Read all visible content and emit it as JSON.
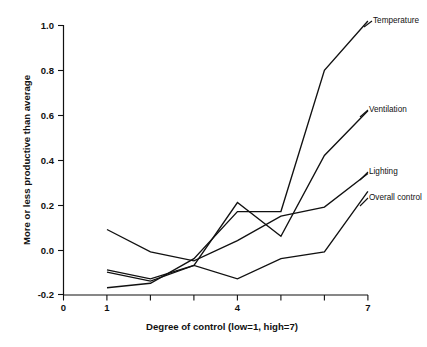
{
  "chart_data": {
    "type": "line",
    "title": "",
    "xlabel": "Degree of control (low=1, high=7)",
    "ylabel": "More or less productive than average",
    "xlim": [
      0,
      7
    ],
    "ylim": [
      -0.2,
      1.0
    ],
    "grid": false,
    "legend_position": "right-inline-labels",
    "x": [
      1,
      2,
      3,
      4,
      5,
      6,
      7
    ],
    "x_tick_values": [
      0,
      1,
      2,
      3,
      4,
      5,
      6,
      7
    ],
    "x_tick_labels": [
      "0",
      "1",
      "",
      "",
      "4",
      "",
      "",
      "7"
    ],
    "y_tick_values": [
      -0.2,
      0.0,
      0.2,
      0.4,
      0.6,
      0.8,
      1.0
    ],
    "y_tick_labels": [
      "-0.2",
      "0.0",
      "0.2",
      "0.4",
      "0.6",
      "0.8",
      "1.0"
    ],
    "series": [
      {
        "name": "Temperature",
        "label": "Temperature",
        "color": "#111111",
        "values": [
          -0.17,
          -0.15,
          -0.04,
          0.17,
          0.17,
          0.8,
          1.02
        ]
      },
      {
        "name": "Ventilation",
        "label": "Ventilation",
        "color": "#111111",
        "values": [
          -0.09,
          -0.13,
          -0.07,
          0.21,
          0.06,
          0.42,
          0.62
        ]
      },
      {
        "name": "Lighting",
        "label": "Lighting",
        "color": "#111111",
        "values": [
          0.09,
          -0.01,
          -0.05,
          0.04,
          0.15,
          0.19,
          0.34
        ]
      },
      {
        "name": "Overall control",
        "label": "Overall control",
        "color": "#111111",
        "values": [
          -0.1,
          -0.14,
          -0.07,
          -0.13,
          -0.04,
          -0.01,
          0.26
        ]
      }
    ]
  },
  "axes": {
    "y_label_text": "More or less productive than average",
    "x_label_text": "Degree of control (low=1, high=7)"
  },
  "labels": {
    "temperature": "Temperature",
    "ventilation": "Ventilation",
    "lighting": "Lighting",
    "overall_control": "Overall control"
  },
  "ticks": {
    "y": [
      "1.0",
      "0.8",
      "0.6",
      "0.4",
      "0.2",
      "0.0",
      "-0.2"
    ],
    "x": [
      "0",
      "1",
      "4",
      "7"
    ]
  },
  "colors": {
    "line": "#111111",
    "axis": "#111111",
    "background": "#ffffff"
  }
}
